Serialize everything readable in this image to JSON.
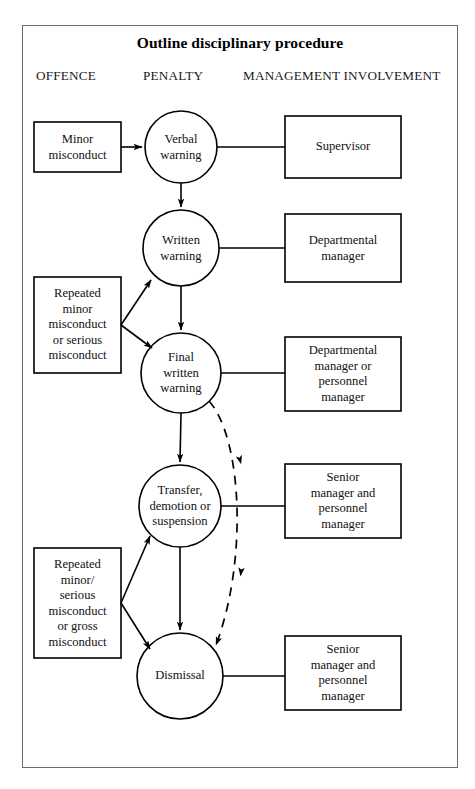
{
  "title": "Outline disciplinary procedure",
  "columns": {
    "offence": "OFFENCE",
    "penalty": "PENALTY",
    "management": "MANAGEMENT INVOLVEMENT"
  },
  "offences": [
    {
      "id": "minor-misconduct",
      "label": "Minor\nmisconduct"
    },
    {
      "id": "repeated-minor-or-serious",
      "label": "Repeated\nminor\nmisconduct\nor serious\nmisconduct"
    },
    {
      "id": "repeated-minor-serious-or-gross",
      "label": "Repeated\nminor/\nserious\nmisconduct\nor gross\nmisconduct"
    }
  ],
  "penalties": [
    {
      "id": "verbal-warning",
      "label": "Verbal\nwarning"
    },
    {
      "id": "written-warning",
      "label": "Written\nwarning"
    },
    {
      "id": "final-written-warning",
      "label": "Final\nwritten\nwarning"
    },
    {
      "id": "transfer-demotion-suspension",
      "label": "Transfer,\ndemotion or\nsuspension"
    },
    {
      "id": "dismissal",
      "label": "Dismissal"
    }
  ],
  "management": [
    {
      "id": "supervisor",
      "label": "Supervisor"
    },
    {
      "id": "departmental-manager",
      "label": "Departmental\nmanager"
    },
    {
      "id": "departmental-or-personnel-manager",
      "label": "Departmental\nmanager or\npersonnel\nmanager"
    },
    {
      "id": "senior-and-personnel-manager-transfer",
      "label": "Senior\nmanager and\npersonnel\nmanager"
    },
    {
      "id": "senior-and-personnel-manager-dismissal",
      "label": "Senior\nmanager and\npersonnel\nmanager"
    }
  ],
  "colors": {
    "stroke": "#000000",
    "frame": "#6d6d6d",
    "background": "#ffffff",
    "text": "#111111"
  }
}
